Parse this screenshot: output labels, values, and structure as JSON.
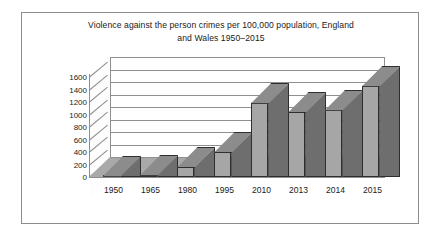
{
  "figure": {
    "title_line1": "Violence against the person crimes per 100,000 population, England",
    "title_line2": "and Wales 1950–2015",
    "border_color": "#8c8c8c",
    "background": "#ffffff"
  },
  "chart_data": {
    "type": "bar",
    "title": "Violence against the person crimes per 100,000 population, England and Wales 1950–2015",
    "xlabel": "",
    "ylabel": "",
    "categories": [
      "1950",
      "1965",
      "1980",
      "1995",
      "2010",
      "2013",
      "2014",
      "2015"
    ],
    "values": [
      15,
      35,
      160,
      400,
      1190,
      1040,
      1080,
      1460
    ],
    "ylim": [
      0,
      1600
    ],
    "yticks": [
      0,
      200,
      400,
      600,
      800,
      1000,
      1200,
      1400,
      1600
    ],
    "ytick_labels": [
      "0",
      "200",
      "400",
      "600",
      "800",
      "1000",
      "1200",
      "1400",
      "1600"
    ],
    "grid": true,
    "legend": false,
    "style": "3d-column",
    "bar_face_color": "#a6a6a6",
    "bar_side_color": "#6e6e6e",
    "bar_top_color": "#8c8c8c",
    "bar_edge_color": "#2e2e2e",
    "floor_color": "#a9a9a9",
    "axis_color": "#8f8f8f"
  }
}
